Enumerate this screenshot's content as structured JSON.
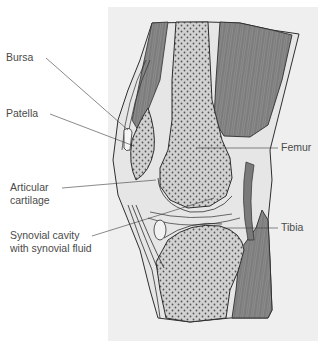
{
  "diagram": {
    "colors": {
      "background": "#ffffff",
      "panel": "#efefef",
      "bone": "#cfcfcf",
      "bone_dots": "#5a5a5a",
      "muscle": "#8a8a8a",
      "outline": "#2e2e2e",
      "leader": "#3a3a3a",
      "label_text": "#4a4a4a"
    },
    "labels": {
      "bursa": "Bursa",
      "patella": "Patella",
      "articular_line1": "Articular",
      "articular_line2": "cartilage",
      "synovial_line1": "Synovial cavity",
      "synovial_line2": "with synovial fluid",
      "femur": "Femur",
      "tibia": "Tibia"
    }
  }
}
